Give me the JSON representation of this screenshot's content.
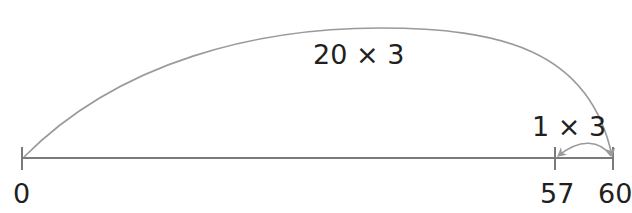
{
  "diagram": {
    "type": "number-line",
    "line_color": "#7a7a7a",
    "arc_color": "#9a9a9a",
    "text_color": "#231f20",
    "ticks": [
      {
        "value": "0",
        "x": 22
      },
      {
        "value": "57",
        "x": 555
      },
      {
        "value": "60",
        "x": 613
      }
    ],
    "jumps": [
      {
        "label": "20 × 3",
        "from": "0",
        "to": "60",
        "direction": "forward"
      },
      {
        "label": "1 × 3",
        "from": "60",
        "to": "57",
        "direction": "backward"
      }
    ]
  }
}
